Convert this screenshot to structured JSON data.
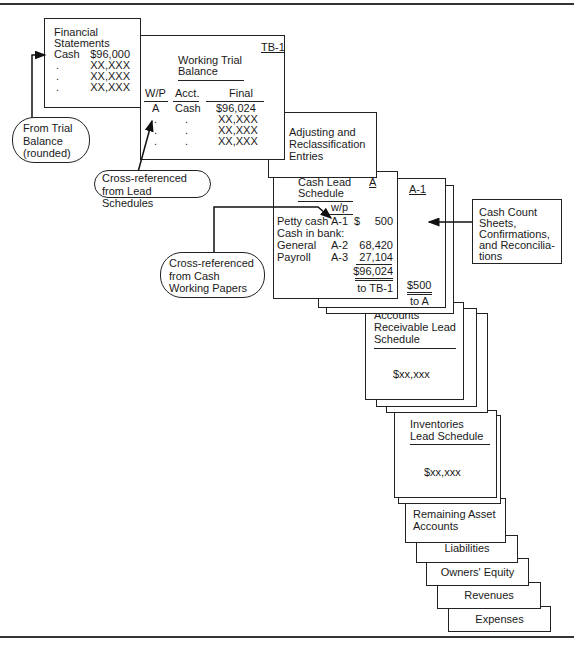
{
  "financial_statements": {
    "title_line1": "Financial",
    "title_line2": "Statements",
    "rows": [
      {
        "label": "Cash",
        "value": "$96,000"
      },
      {
        "label": ".",
        "value": "XX,XXX"
      },
      {
        "label": ".",
        "value": "XX,XXX"
      },
      {
        "label": ".",
        "value": "XX,XXX"
      }
    ]
  },
  "working_trial_balance": {
    "ref": "TB-1",
    "title_line1": "Working Trial",
    "title_line2": "Balance",
    "headers": [
      "W/P",
      "Acct.",
      "Final"
    ],
    "rows": [
      [
        "A",
        "Cash",
        "$96,024"
      ],
      [
        ".",
        ".",
        "XX,XXX"
      ],
      [
        ".",
        ".",
        "XX,XXX"
      ],
      [
        ".",
        ".",
        "XX,XXX"
      ]
    ]
  },
  "adjusting": {
    "line1": "Adjusting and",
    "line2": "Reclassification",
    "line3": "Entries"
  },
  "cash_lead_schedule": {
    "title_line1": "Cash Lead",
    "title_line2": "Schedule",
    "ref": "A",
    "wp_header": "w/p",
    "rows": [
      {
        "label": "Petty cash",
        "wp": "A-1",
        "cur": "$",
        "amount": "500"
      },
      {
        "label": "Cash in bank:",
        "wp": "",
        "cur": "",
        "amount": ""
      },
      {
        "label": "General",
        "wp": "A-2",
        "cur": "",
        "amount": "68,420"
      },
      {
        "label": "Payroll",
        "wp": "A-3",
        "cur": "",
        "amount": "27,104"
      }
    ],
    "total": "$96,024",
    "total_ref": "to TB-1"
  },
  "cash_count_page": {
    "ref": "A-1",
    "total": "$500",
    "total_ref": "to A"
  },
  "cash_count_note": {
    "line1": "Cash Count",
    "line2": "Sheets,",
    "line3": "Confirmations,",
    "line4": "and Reconcilia-",
    "line5": "tions"
  },
  "ar_lead": {
    "line1": "Accounts",
    "line2": "Receivable Lead",
    "line3": "Schedule",
    "value": "$xx,xxx"
  },
  "inventories_lead": {
    "line1": "Inventories",
    "line2": "Lead Schedule",
    "value": "$xx,xxx"
  },
  "stack": {
    "remaining_line1": "Remaining Asset",
    "remaining_line2": "Accounts",
    "liabilities": "Liabilities",
    "owners_equity": "Owners' Equity",
    "revenues": "Revenues",
    "expenses": "Expenses"
  },
  "callouts": {
    "from_trial_balance": [
      "From Trial",
      "Balance",
      "(rounded)"
    ],
    "from_lead_schedules": [
      "Cross-referenced",
      "from Lead Schedules"
    ],
    "from_cash_working_papers": [
      "Cross-referenced",
      "from Cash",
      "Working Papers"
    ]
  }
}
